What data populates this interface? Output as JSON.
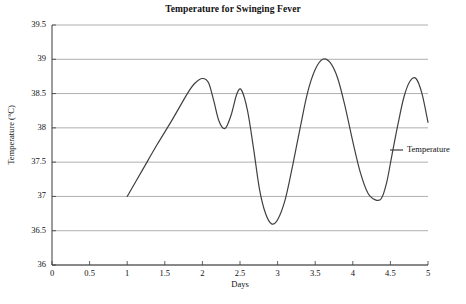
{
  "chart_data": {
    "type": "line",
    "title": "Temperature for Swinging Fever",
    "xlabel": "Days",
    "ylabel": "Temperature (°C)",
    "xlim": [
      0,
      5
    ],
    "ylim": [
      36,
      39.5
    ],
    "grid": "horizontal",
    "legend_position": "right-middle",
    "x_ticks": [
      "0",
      "0.5",
      "1",
      "1.5",
      "2",
      "2.5",
      "3",
      "3.5",
      "4",
      "4.5",
      "5"
    ],
    "x_tick_values": [
      0,
      0.5,
      1,
      1.5,
      2,
      2.5,
      3,
      3.5,
      4,
      4.5,
      5
    ],
    "y_ticks": [
      "36",
      "36.5",
      "37",
      "37.5",
      "38",
      "38.5",
      "39",
      "39.5"
    ],
    "y_tick_values": [
      36,
      36.5,
      37,
      37.5,
      38,
      38.5,
      39,
      39.5
    ],
    "series": [
      {
        "name": "Temperature",
        "color": "#404040",
        "x": [
          1.0,
          1.2,
          1.4,
          1.6,
          1.8,
          1.9,
          2.0,
          2.08,
          2.15,
          2.22,
          2.3,
          2.38,
          2.46,
          2.52,
          2.6,
          2.68,
          2.76,
          2.84,
          2.92,
          3.0,
          3.1,
          3.2,
          3.3,
          3.4,
          3.5,
          3.6,
          3.7,
          3.8,
          3.9,
          4.0,
          4.1,
          4.2,
          4.3,
          4.38,
          4.45,
          4.52,
          4.6,
          4.68,
          4.76,
          4.84,
          4.92,
          5.0
        ],
        "y": [
          37.0,
          37.38,
          37.76,
          38.12,
          38.5,
          38.65,
          38.72,
          38.66,
          38.4,
          38.1,
          37.99,
          38.18,
          38.5,
          38.55,
          38.25,
          37.7,
          37.1,
          36.75,
          36.6,
          36.66,
          36.95,
          37.45,
          38.0,
          38.52,
          38.85,
          39.0,
          38.95,
          38.72,
          38.3,
          37.8,
          37.35,
          37.05,
          36.95,
          36.97,
          37.2,
          37.6,
          38.05,
          38.45,
          38.68,
          38.72,
          38.5,
          38.08
        ]
      }
    ],
    "annotations": {
      "start_point": {
        "x": 1.0,
        "y": 37.0
      },
      "peak_1": {
        "x": 2.0,
        "y": 38.72
      },
      "local_min_1": {
        "x": 2.3,
        "y": 37.99
      },
      "peak_2": {
        "x": 2.52,
        "y": 38.55
      },
      "global_min": {
        "x": 2.92,
        "y": 36.6
      },
      "global_max": {
        "x": 3.6,
        "y": 39.0
      },
      "local_min_2": {
        "x": 4.3,
        "y": 36.95
      },
      "peak_3": {
        "x": 4.84,
        "y": 38.72
      },
      "end_point": {
        "x": 5.0,
        "y": 38.08
      }
    }
  },
  "legend": {
    "items": [
      {
        "label": "Temperature"
      }
    ]
  },
  "colors": {
    "line": "#404040",
    "grid": "#9a9a9a",
    "axis": "#3a3a3a",
    "background": "#ffffff"
  }
}
